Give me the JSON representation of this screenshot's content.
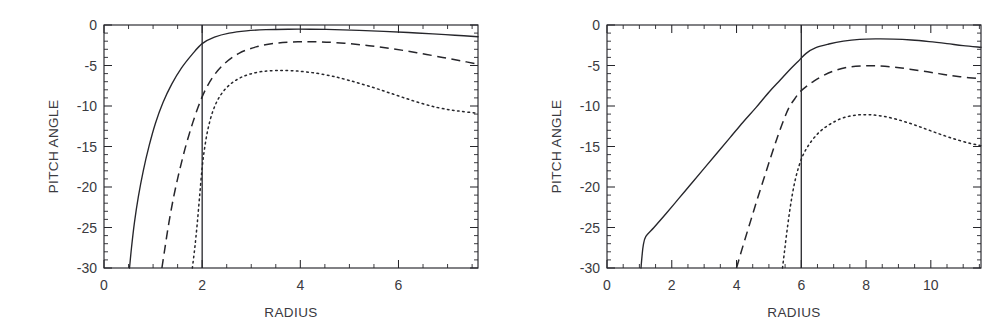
{
  "figure": {
    "background": "#ffffff",
    "ink_color": "#26262b",
    "panel_count": 2
  },
  "chart_data": [
    {
      "type": "line",
      "panel": "left",
      "title": "",
      "xlabel": "RADIUS",
      "ylabel": "PITCH ANGLE",
      "xlim": [
        0,
        7.62
      ],
      "ylim": [
        -30,
        0
      ],
      "xticks": [
        0,
        2,
        4,
        6
      ],
      "xtick_labels": [
        "0",
        "2",
        "4",
        "6"
      ],
      "xtick_minor_step": 0.5,
      "yticks": [
        0,
        -5,
        -10,
        -15,
        -20,
        -25,
        -30
      ],
      "ytick_labels": [
        "0",
        "-5",
        "-10",
        "-15",
        "-20",
        "-25",
        "-30"
      ],
      "ytick_minor_step": 1,
      "grid": false,
      "legend": "none",
      "annotations": [
        {
          "kind": "vertical-line",
          "x": 2.0,
          "label": "corotation radius"
        }
      ],
      "series": [
        {
          "name": "solid",
          "style": "solid",
          "x": [
            0.52,
            0.56,
            0.62,
            0.7,
            0.8,
            0.92,
            1.05,
            1.2,
            1.38,
            1.58,
            1.8,
            2.0,
            2.25,
            2.55,
            2.9,
            3.3,
            3.75,
            4.2,
            4.7,
            5.2,
            5.7,
            6.2,
            6.7,
            7.15,
            7.62
          ],
          "y": [
            -30.0,
            -27.5,
            -24.4,
            -21.2,
            -18.0,
            -14.9,
            -12.1,
            -9.6,
            -7.3,
            -5.3,
            -3.6,
            -2.3,
            -1.5,
            -1.0,
            -0.72,
            -0.58,
            -0.52,
            -0.52,
            -0.57,
            -0.66,
            -0.78,
            -0.93,
            -1.1,
            -1.26,
            -1.45
          ]
        },
        {
          "name": "dashed",
          "style": "dashed",
          "x": [
            1.18,
            1.24,
            1.32,
            1.42,
            1.53,
            1.65,
            1.78,
            1.92,
            2.05,
            2.22,
            2.45,
            2.75,
            3.1,
            3.5,
            3.95,
            4.4,
            4.9,
            5.4,
            5.9,
            6.4,
            6.9,
            7.3,
            7.62
          ],
          "y": [
            -30.0,
            -27.6,
            -24.5,
            -21.2,
            -18.2,
            -15.3,
            -12.6,
            -10.1,
            -8.2,
            -6.4,
            -4.8,
            -3.5,
            -2.7,
            -2.25,
            -2.08,
            -2.08,
            -2.25,
            -2.55,
            -2.95,
            -3.45,
            -4.0,
            -4.45,
            -4.85
          ]
        },
        {
          "name": "dotted",
          "style": "dotted",
          "x": [
            1.8,
            1.85,
            1.9,
            1.95,
            2.0,
            2.05,
            2.12,
            2.22,
            2.35,
            2.52,
            2.72,
            2.95,
            3.22,
            3.52,
            3.85,
            4.2,
            4.6,
            5.0,
            5.45,
            5.9,
            6.35,
            6.8,
            7.2,
            7.62
          ],
          "y": [
            -30.0,
            -27.5,
            -24.5,
            -21.0,
            -17.6,
            -15.2,
            -12.8,
            -10.6,
            -8.9,
            -7.6,
            -6.7,
            -6.1,
            -5.75,
            -5.62,
            -5.65,
            -5.85,
            -6.25,
            -6.85,
            -7.65,
            -8.55,
            -9.45,
            -10.2,
            -10.6,
            -10.9
          ]
        }
      ]
    },
    {
      "type": "line",
      "panel": "right",
      "title": "",
      "xlabel": "RADIUS",
      "ylabel": "PITCH ANGLE",
      "xlim": [
        0,
        11.55
      ],
      "ylim": [
        -30,
        0
      ],
      "xticks": [
        0,
        2,
        4,
        6,
        8,
        10
      ],
      "xtick_labels": [
        "0",
        "2",
        "4",
        "6",
        "8",
        "10"
      ],
      "xtick_minor_step": 0.5,
      "yticks": [
        0,
        -5,
        -10,
        -15,
        -20,
        -25,
        -30
      ],
      "ytick_labels": [
        "0",
        "-5",
        "-10",
        "-15",
        "-20",
        "-25",
        "-30"
      ],
      "ytick_minor_step": 1,
      "grid": false,
      "legend": "none",
      "annotations": [
        {
          "kind": "vertical-line",
          "x": 6.0,
          "label": "corotation radius"
        }
      ],
      "series": [
        {
          "name": "solid",
          "style": "solid",
          "x": [
            1.05,
            1.08,
            1.12,
            1.2,
            1.45,
            1.8,
            2.2,
            2.6,
            3.0,
            3.4,
            3.8,
            4.2,
            4.6,
            5.0,
            5.35,
            5.65,
            5.9,
            6.15,
            6.45,
            6.85,
            7.3,
            7.8,
            8.3,
            8.85,
            9.4,
            9.95,
            10.5,
            11.0,
            11.55
          ],
          "y": [
            -30.0,
            -28.6,
            -27.2,
            -26.1,
            -25.0,
            -23.4,
            -21.5,
            -19.6,
            -17.7,
            -15.8,
            -13.9,
            -12.0,
            -10.2,
            -8.3,
            -6.8,
            -5.5,
            -4.5,
            -3.5,
            -2.8,
            -2.35,
            -2.0,
            -1.78,
            -1.72,
            -1.74,
            -1.85,
            -2.05,
            -2.3,
            -2.55,
            -2.75
          ]
        },
        {
          "name": "dashed",
          "style": "dashed",
          "x": [
            4.0,
            4.1,
            4.25,
            4.45,
            4.65,
            4.85,
            5.05,
            5.25,
            5.45,
            5.62,
            5.8,
            5.95,
            6.15,
            6.4,
            6.7,
            7.05,
            7.45,
            7.9,
            8.35,
            8.85,
            9.35,
            9.9,
            10.4,
            10.9,
            11.55
          ],
          "y": [
            -30.0,
            -28.6,
            -26.6,
            -24.0,
            -21.4,
            -18.9,
            -16.4,
            -14.0,
            -11.8,
            -10.2,
            -9.1,
            -8.3,
            -7.6,
            -6.9,
            -6.2,
            -5.6,
            -5.2,
            -5.05,
            -5.05,
            -5.2,
            -5.45,
            -5.78,
            -6.1,
            -6.38,
            -6.65
          ]
        },
        {
          "name": "dotted",
          "style": "dotted",
          "x": [
            5.42,
            5.48,
            5.55,
            5.63,
            5.72,
            5.82,
            5.93,
            6.05,
            6.2,
            6.4,
            6.65,
            6.95,
            7.3,
            7.7,
            8.1,
            8.5,
            8.95,
            9.4,
            9.85,
            10.3,
            10.75,
            11.2,
            11.55
          ],
          "y": [
            -30.0,
            -28.0,
            -25.7,
            -23.3,
            -21.0,
            -19.0,
            -17.4,
            -16.1,
            -15.0,
            -13.9,
            -12.9,
            -12.1,
            -11.45,
            -11.12,
            -11.08,
            -11.25,
            -11.65,
            -12.2,
            -12.85,
            -13.5,
            -14.1,
            -14.6,
            -14.9
          ]
        }
      ]
    }
  ]
}
